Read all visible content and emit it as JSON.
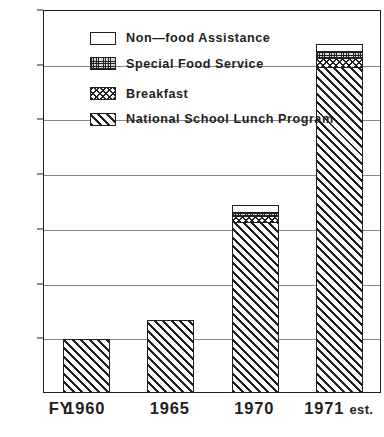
{
  "chart_data": {
    "type": "bar",
    "subtype": "stacked-vertical",
    "title": "",
    "subtitle": "",
    "xlabel": "FY",
    "ylabel": "",
    "ylim": [
      0,
      700
    ],
    "ytick_step": 100,
    "grid": true,
    "grid_axis": "y",
    "legend_position": "upper-left-inside",
    "categories": [
      "1960",
      "1965",
      "1970",
      "1971 est."
    ],
    "category_suffixes": [
      "",
      "",
      "",
      "est."
    ],
    "yticks": [
      "100",
      "200",
      "300",
      "400",
      "500",
      "600",
      "700"
    ],
    "ytick_values": [
      100,
      200,
      300,
      400,
      500,
      600,
      700
    ],
    "series": [
      {
        "name": "National School Lunch Program",
        "pattern": "diagonal-hatch",
        "values": [
          96,
          132,
          312,
          595
        ]
      },
      {
        "name": "Breakfast",
        "pattern": "crosshatch",
        "values": [
          0,
          0,
          11,
          17
        ]
      },
      {
        "name": "Special Food Service",
        "pattern": "fine-stipple",
        "values": [
          0,
          0,
          8,
          13
        ]
      },
      {
        "name": "Non-food Assistance",
        "pattern": "solid-white",
        "values": [
          0,
          0,
          10,
          11
        ]
      }
    ],
    "totals": [
      96,
      132,
      341,
      636
    ]
  },
  "legend": {
    "items": [
      {
        "label": "Non—food  Assistance",
        "pattern": "solid-white",
        "series_index": 3
      },
      {
        "label": "Special  Food  Service",
        "pattern": "fine-stipple",
        "series_index": 2
      },
      {
        "label": "Breakfast",
        "pattern": "crosshatch",
        "series_index": 1
      },
      {
        "label": "National  School  Lunch  Program",
        "pattern": "diagonal-hatch",
        "series_index": 0
      }
    ]
  },
  "axis": {
    "x_prefix_label": "FY",
    "y_labels": [
      "700",
      "600",
      "500",
      "400",
      "300",
      "200",
      "100"
    ],
    "x_labels": [
      "1960",
      "1965",
      "1970",
      "1971"
    ],
    "x_last_suffix": "est."
  },
  "colors": {
    "ink": "#231f20",
    "grid": "#8a8a8a",
    "background": "#ffffff",
    "stipple_fill": "#d9d9d9"
  }
}
